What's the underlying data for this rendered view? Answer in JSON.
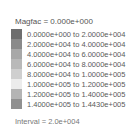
{
  "legend": {
    "title": "Magfac = 0.000e+000",
    "rows": [
      {
        "label": "0.0000e+000 to  2.0000e+004",
        "color": "#6e6e6e"
      },
      {
        "label": "2.0000e+004 to  4.0000e+004",
        "color": "#8a8a8a"
      },
      {
        "label": "4.0000e+004 to  6.0000e+004",
        "color": "#a8a8a8"
      },
      {
        "label": "6.0000e+004 to  8.0000e+004",
        "color": "#b9b9b9"
      },
      {
        "label": "8.0000e+004 to  1.0000e+005",
        "color": "#cfcfcf"
      },
      {
        "label": "1.0000e+005 to  1.2000e+005",
        "color": "#ececec"
      },
      {
        "label": "1.2000e+005 to  1.4000e+005",
        "color": "#b4b4b4"
      },
      {
        "label": "1.4000e+005 to  1.4430e+005",
        "color": "#909090"
      }
    ],
    "interval": "Interval = 2.0e+004"
  }
}
